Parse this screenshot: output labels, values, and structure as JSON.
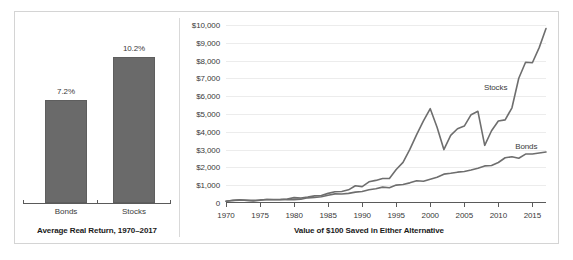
{
  "figure": {
    "border_color": "#d4d4d4",
    "background": "#ffffff"
  },
  "bar_panel": {
    "caption": "Average Real Return, 1970–2017",
    "categories": [
      "Bonds",
      "Stocks"
    ],
    "value_labels": [
      "7.2%",
      "10.2%"
    ]
  },
  "line_panel": {
    "caption": "Value of $100 Saved in Either Alternative",
    "series_labels": {
      "stocks": "Stocks",
      "bonds": "Bonds"
    }
  },
  "chart_data": [
    {
      "type": "bar",
      "title": "Average Real Return, 1970–2017",
      "categories": [
        "Bonds",
        "Stocks"
      ],
      "values": [
        7.2,
        10.2
      ],
      "value_labels": [
        "7.2%",
        "10.2%"
      ],
      "unit": "percent",
      "xlabel": "",
      "ylabel": "",
      "ylim": [
        0,
        11.5
      ],
      "grid": false,
      "bar_color": "#6a6a6a"
    },
    {
      "type": "line",
      "title": "Value of $100 Saved in Either Alternative",
      "xlabel": "",
      "ylabel": "",
      "xlim": [
        1970,
        2017
      ],
      "ylim": [
        0,
        10000
      ],
      "grid": true,
      "legend": "inline-labels",
      "ytick_labels": [
        "0",
        "$1,000",
        "$2,000",
        "$3,000",
        "$4,000",
        "$5,000",
        "$6,000",
        "$7,000",
        "$8,000",
        "$9,000",
        "$10,000"
      ],
      "ytick_values": [
        0,
        1000,
        2000,
        3000,
        4000,
        5000,
        6000,
        7000,
        8000,
        9000,
        10000
      ],
      "xtick_labels": [
        "1970",
        "1975",
        "1980",
        "1985",
        "1990",
        "1995",
        "2000",
        "2005",
        "2010",
        "2015"
      ],
      "xtick_values": [
        1970,
        1975,
        1980,
        1985,
        1990,
        1995,
        2000,
        2005,
        2010,
        2015
      ],
      "x": [
        1970,
        1971,
        1972,
        1973,
        1974,
        1975,
        1976,
        1977,
        1978,
        1979,
        1980,
        1981,
        1982,
        1983,
        1984,
        1985,
        1986,
        1987,
        1988,
        1989,
        1990,
        1991,
        1992,
        1993,
        1994,
        1995,
        1996,
        1997,
        1998,
        1999,
        2000,
        2001,
        2002,
        2003,
        2004,
        2005,
        2006,
        2007,
        2008,
        2009,
        2010,
        2011,
        2012,
        2013,
        2014,
        2015,
        2016,
        2017
      ],
      "series": [
        {
          "name": "Stocks",
          "color": "#6e6e6e",
          "values": [
            100,
            112,
            130,
            112,
            84,
            110,
            134,
            126,
            132,
            152,
            196,
            188,
            224,
            268,
            280,
            360,
            420,
            438,
            500,
            650,
            620,
            800,
            856,
            930,
            930,
            1270,
            1540,
            2030,
            2590,
            3110,
            2870,
            2500,
            1960,
            2500,
            2740,
            2840,
            3260,
            3390,
            2130,
            2670,
            3030,
            3070,
            3520,
            4610,
            5200,
            5180,
            5740,
            6920
          ],
          "note": "Index series scaled so that the right-hand curve peaks near $5,300 in 2000, troughs near $1,950 in 2002, dips near $2,100 in 2008 and finishes near $9,800 in 2017."
        },
        {
          "name": "Bonds",
          "color": "#6e6e6e",
          "values": [
            100,
            106,
            112,
            110,
            106,
            116,
            134,
            136,
            134,
            132,
            132,
            146,
            196,
            212,
            240,
            298,
            346,
            342,
            366,
            414,
            440,
            506,
            542,
            604,
            580,
            680,
            700,
            766,
            844,
            826,
            904,
            978,
            1096,
            1130,
            1172,
            1196,
            1252,
            1322,
            1410,
            1426,
            1540,
            1720,
            1760,
            1700,
            1860,
            1860,
            1900,
            1940
          ],
          "note": "Bonds curve rises smoothly to roughly $2,800 by 2017."
        }
      ],
      "series_plot_points": {
        "stocks": [
          [
            1970,
            100
          ],
          [
            1971,
            150
          ],
          [
            1972,
            180
          ],
          [
            1973,
            150
          ],
          [
            1974,
            110
          ],
          [
            1975,
            160
          ],
          [
            1976,
            200
          ],
          [
            1977,
            180
          ],
          [
            1978,
            190
          ],
          [
            1979,
            225
          ],
          [
            1980,
            300
          ],
          [
            1981,
            280
          ],
          [
            1982,
            330
          ],
          [
            1983,
            400
          ],
          [
            1984,
            420
          ],
          [
            1985,
            540
          ],
          [
            1986,
            630
          ],
          [
            1987,
            650
          ],
          [
            1988,
            740
          ],
          [
            1989,
            970
          ],
          [
            1990,
            920
          ],
          [
            1991,
            1190
          ],
          [
            1992,
            1270
          ],
          [
            1993,
            1380
          ],
          [
            1994,
            1380
          ],
          [
            1995,
            1880
          ],
          [
            1996,
            2280
          ],
          [
            1997,
            3010
          ],
          [
            1998,
            3840
          ],
          [
            1999,
            4610
          ],
          [
            2000,
            5300
          ],
          [
            2001,
            4250
          ],
          [
            2002,
            3000
          ],
          [
            2003,
            3800
          ],
          [
            2004,
            4170
          ],
          [
            2005,
            4320
          ],
          [
            2006,
            4960
          ],
          [
            2007,
            5150
          ],
          [
            2008,
            3240
          ],
          [
            2009,
            4060
          ],
          [
            2010,
            4610
          ],
          [
            2011,
            4670
          ],
          [
            2012,
            5350
          ],
          [
            2013,
            7010
          ],
          [
            2014,
            7910
          ],
          [
            2015,
            7880
          ],
          [
            2016,
            8730
          ],
          [
            2017,
            9800
          ]
        ],
        "bonds": [
          [
            1970,
            100
          ],
          [
            1971,
            140
          ],
          [
            1972,
            160
          ],
          [
            1973,
            155
          ],
          [
            1974,
            150
          ],
          [
            1975,
            170
          ],
          [
            1976,
            200
          ],
          [
            1977,
            200
          ],
          [
            1978,
            195
          ],
          [
            1979,
            192
          ],
          [
            1980,
            192
          ],
          [
            1981,
            215
          ],
          [
            1982,
            290
          ],
          [
            1983,
            312
          ],
          [
            1984,
            355
          ],
          [
            1985,
            440
          ],
          [
            1986,
            512
          ],
          [
            1987,
            505
          ],
          [
            1988,
            540
          ],
          [
            1989,
            612
          ],
          [
            1990,
            650
          ],
          [
            1991,
            748
          ],
          [
            1992,
            800
          ],
          [
            1993,
            892
          ],
          [
            1994,
            856
          ],
          [
            1995,
            1005
          ],
          [
            1996,
            1035
          ],
          [
            1997,
            1132
          ],
          [
            1998,
            1247
          ],
          [
            1999,
            1220
          ],
          [
            2000,
            1335
          ],
          [
            2001,
            1445
          ],
          [
            2002,
            1620
          ],
          [
            2003,
            1670
          ],
          [
            2004,
            1732
          ],
          [
            2005,
            1767
          ],
          [
            2006,
            1850
          ],
          [
            2007,
            1954
          ],
          [
            2008,
            2084
          ],
          [
            2009,
            2107
          ],
          [
            2010,
            2276
          ],
          [
            2011,
            2542
          ],
          [
            2012,
            2600
          ],
          [
            2013,
            2512
          ],
          [
            2014,
            2749
          ],
          [
            2015,
            2749
          ],
          [
            2016,
            2808
          ],
          [
            2017,
            2867
          ]
        ]
      }
    }
  ]
}
